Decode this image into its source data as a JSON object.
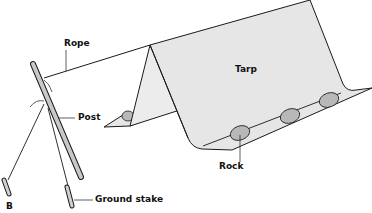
{
  "diagram": {
    "type": "illustration",
    "labels": {
      "rope": "Rope",
      "post": "Post",
      "ground_stake": "Ground stake",
      "tarp": "Tarp",
      "rock": "Rock",
      "figure_letter": "B"
    },
    "colors": {
      "tarp_fill": "#e6e6e6",
      "rock_fill": "#b8b8b8",
      "post_fill": "#c8c8c8",
      "line": "#1a1a1a"
    }
  }
}
